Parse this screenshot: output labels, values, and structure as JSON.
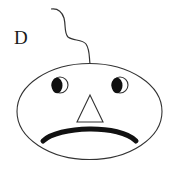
{
  "figure": {
    "label": "D",
    "colors": {
      "stroke": "#333333",
      "fill_dark": "#111111",
      "background": "#ffffff"
    },
    "parts": {
      "hair": "single-curly-hair",
      "head": "ellipse-head",
      "eyes": [
        "left-eye",
        "right-eye"
      ],
      "nose": "triangle-nose",
      "mouth": "frown-mouth"
    }
  }
}
